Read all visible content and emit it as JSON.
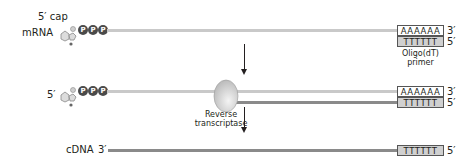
{
  "diagram": {
    "step1": {
      "cap_label": "5′ cap",
      "strand_label": "mRNA",
      "phosphates": [
        "P",
        "P",
        "P"
      ],
      "polyA": "AAAAAA",
      "polyA_end": "3′",
      "primer": "TTTTTT",
      "primer_end": "5′",
      "primer_label_line1": "Oligo(dT)",
      "primer_label_line2": "primer"
    },
    "step2": {
      "five_prime_label": "5′",
      "phosphates": [
        "P",
        "P",
        "P"
      ],
      "enzyme_label_line1": "Reverse",
      "enzyme_label_line2": "transcriptase",
      "polyA": "AAAAAA",
      "polyA_end": "3′",
      "primer": "TTTTTT",
      "primer_end": "5′"
    },
    "step3": {
      "strand_label": "cDNA",
      "three_prime_label": "3′",
      "primer": "TTTTTT",
      "primer_end": "5′"
    },
    "colors": {
      "mrna_strand": "#c9c9c9",
      "cdna_strand": "#8a8a8a",
      "phosphate": "#4a4a4a",
      "primer_fill": "#d0d0d0",
      "enzyme": "#d6d6d6"
    }
  }
}
